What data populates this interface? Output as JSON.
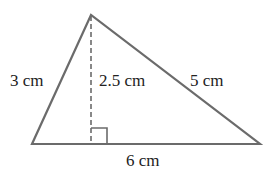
{
  "figure": {
    "type": "triangle",
    "stroke_color": "#6b6b6b",
    "labels": {
      "left_side": "3 cm",
      "height": "2.5 cm",
      "right_side": "5 cm",
      "base": "6 cm"
    },
    "right_angle_marker": true
  }
}
